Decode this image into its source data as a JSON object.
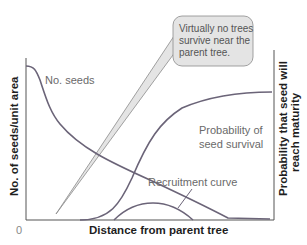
{
  "diagram": {
    "x_axis_title": "Distance from parent tree",
    "y_axis_left_title": "No. of seeds/unit area",
    "y_axis_right_title_line1": "Probability that seed will",
    "y_axis_right_title_line2": "reach maturity",
    "origin_label": "0",
    "curves": {
      "seeds_label": "No. seeds",
      "survival_label_line1": "Probability of",
      "survival_label_line2": "seed survival",
      "recruitment_label": "Recruitment curve"
    },
    "callout": {
      "line1": "Virtually no trees",
      "line2": "survive near the",
      "line3": "parent tree."
    },
    "colors": {
      "curve": "#6b6478",
      "axis": "#444444",
      "callout_fill": "#e4e4e4",
      "callout_stroke": "#8a8a8a"
    }
  }
}
